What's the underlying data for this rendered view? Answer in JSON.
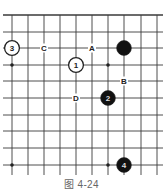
{
  "figure": {
    "caption": "图 4-24",
    "grid": {
      "x_lines": [
        12,
        28,
        44,
        60,
        76,
        92,
        108,
        124,
        141,
        157
      ],
      "y_lines": [
        15,
        32,
        48,
        65,
        81,
        98,
        115,
        131,
        148,
        165
      ],
      "x_extent": [
        3,
        163
      ],
      "y_extent": [
        15,
        178
      ],
      "line_color": "#3a3a3a",
      "top_edge_bold": true
    },
    "star_points": [
      {
        "x": 12,
        "y": 65
      },
      {
        "x": 108,
        "y": 65
      },
      {
        "x": 12,
        "y": 165
      },
      {
        "x": 108,
        "y": 165
      }
    ],
    "stones": [
      {
        "color": "white",
        "label": "3",
        "x": 12,
        "y": 48
      },
      {
        "color": "white",
        "label": "1",
        "x": 76,
        "y": 65
      },
      {
        "color": "black",
        "label": "",
        "x": 124,
        "y": 48
      },
      {
        "color": "black",
        "label": "2",
        "x": 108,
        "y": 98
      },
      {
        "color": "black",
        "label": "4",
        "x": 124,
        "y": 165
      }
    ],
    "markers": [
      {
        "label": "C",
        "x": 44,
        "y": 48
      },
      {
        "label": "A",
        "x": 92,
        "y": 48
      },
      {
        "label": "B",
        "x": 124,
        "y": 81
      },
      {
        "label": "D",
        "x": 76,
        "y": 98
      }
    ]
  }
}
